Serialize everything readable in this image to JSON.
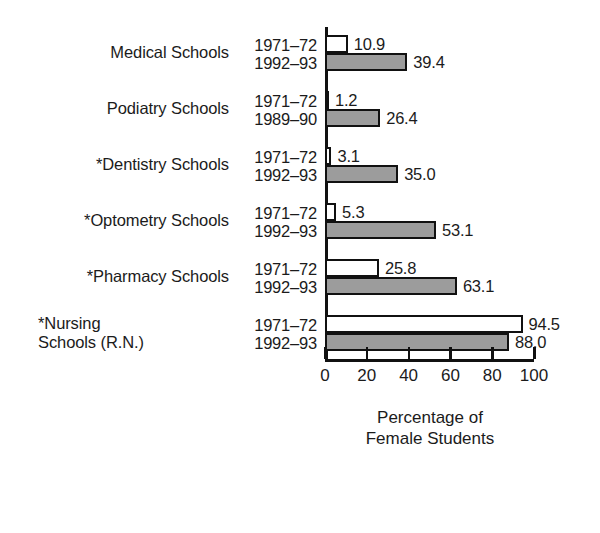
{
  "chart_data": {
    "type": "bar",
    "orientation": "horizontal",
    "title": "",
    "xlabel": "Percentage of\nFemale Students",
    "ylabel": "",
    "xlim": [
      0,
      100
    ],
    "xticks": [
      0,
      20,
      40,
      60,
      80,
      100
    ],
    "xtick_labels": [
      "0",
      "20",
      "40",
      "60",
      "80",
      "100"
    ],
    "grid": false,
    "legend": "none",
    "series": [
      {
        "name": "earlier year",
        "fill": "#ffffff",
        "edge": "#111111"
      },
      {
        "name": "later year",
        "fill": "#9c9c9c",
        "edge": "#111111"
      }
    ],
    "categories": [
      "Medical Schools",
      "Podiatry Schools",
      "*Dentistry Schools",
      "*Optometry Schools",
      "*Pharmacy Schools",
      "*Nursing\nSchools (R.N.)"
    ],
    "groups": [
      {
        "category": "Medical Schools",
        "two_line": false,
        "bars": [
          {
            "year": "1971–72",
            "value": 10.9,
            "value_label": "10.9",
            "style": "early"
          },
          {
            "year": "1992–93",
            "value": 39.4,
            "value_label": "39.4",
            "style": "late"
          }
        ]
      },
      {
        "category": "Podiatry Schools",
        "two_line": false,
        "bars": [
          {
            "year": "1971–72",
            "value": 1.2,
            "value_label": "1.2",
            "style": "early"
          },
          {
            "year": "1989–90",
            "value": 26.4,
            "value_label": "26.4",
            "style": "late"
          }
        ]
      },
      {
        "category": "*Dentistry Schools",
        "two_line": false,
        "bars": [
          {
            "year": "1971–72",
            "value": 3.1,
            "value_label": "3.1",
            "style": "early"
          },
          {
            "year": "1992–93",
            "value": 35.0,
            "value_label": "35.0",
            "style": "late"
          }
        ]
      },
      {
        "category": "*Optometry Schools",
        "two_line": false,
        "bars": [
          {
            "year": "1971–72",
            "value": 5.3,
            "value_label": "5.3",
            "style": "early"
          },
          {
            "year": "1992–93",
            "value": 53.1,
            "value_label": "53.1",
            "style": "late"
          }
        ]
      },
      {
        "category": "*Pharmacy Schools",
        "two_line": false,
        "bars": [
          {
            "year": "1971–72",
            "value": 25.8,
            "value_label": "25.8",
            "style": "early"
          },
          {
            "year": "1992–93",
            "value": 63.1,
            "value_label": "63.1",
            "style": "late"
          }
        ]
      },
      {
        "category": "*Nursing\nSchools (R.N.)",
        "two_line": true,
        "bars": [
          {
            "year": "1971–72",
            "value": 94.5,
            "value_label": "94.5",
            "style": "early"
          },
          {
            "year": "1992–93",
            "value": 88.0,
            "value_label": "88.0",
            "style": "late"
          }
        ]
      }
    ]
  }
}
